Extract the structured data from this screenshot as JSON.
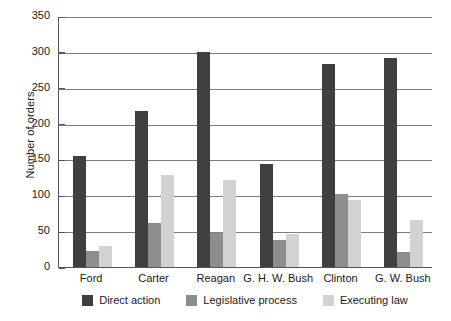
{
  "chart_data": {
    "type": "bar",
    "title": "",
    "xlabel": "",
    "ylabel": "Number of orders",
    "ylim": [
      0,
      350
    ],
    "yticks": [
      0,
      50,
      100,
      150,
      200,
      250,
      300,
      350
    ],
    "grid": true,
    "legend_position": "bottom",
    "categories": [
      "Ford",
      "Carter",
      "Reagan",
      "G. H. W. Bush",
      "Clinton",
      "G. W. Bush"
    ],
    "series": [
      {
        "name": "Direct action",
        "color": "#3f3f3f",
        "values": [
          155,
          217,
          300,
          143,
          283,
          291
        ]
      },
      {
        "name": "Legislative process",
        "color": "#8d8d8d",
        "values": [
          22,
          62,
          48,
          38,
          102,
          21
        ]
      },
      {
        "name": "Executing law",
        "color": "#d2d2d2",
        "values": [
          30,
          128,
          122,
          46,
          93,
          65
        ]
      }
    ]
  }
}
